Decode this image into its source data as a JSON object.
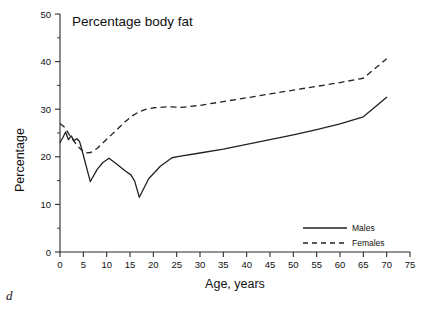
{
  "panel": {
    "label": "d"
  },
  "chart_data": {
    "type": "line",
    "title": "Percentage body fat",
    "xlabel": "Age, years",
    "ylabel": "Percentage",
    "xlim": [
      0,
      75
    ],
    "ylim": [
      0,
      50
    ],
    "xticks": [
      0,
      5,
      10,
      15,
      20,
      25,
      30,
      35,
      40,
      45,
      50,
      55,
      60,
      65,
      70,
      75
    ],
    "yticks": [
      0,
      10,
      20,
      30,
      40,
      50
    ],
    "yminorticks": [
      5,
      15,
      25,
      35,
      45
    ],
    "grid": false,
    "legend_position": "bottom-right",
    "series": [
      {
        "name": "Males",
        "style": "solid",
        "color": "#222222",
        "points": [
          [
            0,
            23.0
          ],
          [
            0.6,
            24.0
          ],
          [
            1.2,
            25.2
          ],
          [
            1.8,
            23.6
          ],
          [
            2.4,
            24.4
          ],
          [
            3.0,
            23.4
          ],
          [
            3.6,
            23.8
          ],
          [
            4.2,
            23.2
          ],
          [
            4.6,
            21.8
          ],
          [
            6.5,
            14.8
          ],
          [
            8.0,
            17.4
          ],
          [
            9.2,
            18.8
          ],
          [
            10.5,
            19.7
          ],
          [
            12.0,
            18.6
          ],
          [
            14.0,
            17.0
          ],
          [
            15.2,
            16.2
          ],
          [
            16.0,
            14.9
          ],
          [
            17.0,
            11.5
          ],
          [
            19.0,
            15.4
          ],
          [
            21.5,
            18.0
          ],
          [
            24.0,
            19.8
          ],
          [
            25.5,
            20.1
          ],
          [
            30.0,
            20.8
          ],
          [
            35.0,
            21.6
          ],
          [
            40.0,
            22.6
          ],
          [
            45.0,
            23.6
          ],
          [
            50.0,
            24.6
          ],
          [
            55.0,
            25.7
          ],
          [
            60.0,
            26.9
          ],
          [
            65.0,
            28.4
          ],
          [
            70.0,
            32.5
          ]
        ]
      },
      {
        "name": "Females",
        "style": "dashed",
        "color": "#222222",
        "points": [
          [
            0,
            27.0
          ],
          [
            1.0,
            26.2
          ],
          [
            2.0,
            24.6
          ],
          [
            3.2,
            23.0
          ],
          [
            4.4,
            21.6
          ],
          [
            5.6,
            20.8
          ],
          [
            6.6,
            20.9
          ],
          [
            8.0,
            21.8
          ],
          [
            9.5,
            23.2
          ],
          [
            11.0,
            24.6
          ],
          [
            12.5,
            26.0
          ],
          [
            14.0,
            27.4
          ],
          [
            15.5,
            28.6
          ],
          [
            17.0,
            29.5
          ],
          [
            18.5,
            30.0
          ],
          [
            20.0,
            30.3
          ],
          [
            23.0,
            30.5
          ],
          [
            26.0,
            30.4
          ],
          [
            30.0,
            30.8
          ],
          [
            35.0,
            31.6
          ],
          [
            40.0,
            32.4
          ],
          [
            45.0,
            33.2
          ],
          [
            50.0,
            34.0
          ],
          [
            55.0,
            34.8
          ],
          [
            60.0,
            35.6
          ],
          [
            65.0,
            36.5
          ],
          [
            70.0,
            40.6
          ]
        ]
      }
    ]
  },
  "legend": {
    "items": [
      {
        "label": "Males",
        "style": "solid"
      },
      {
        "label": "Females",
        "style": "dashed"
      }
    ]
  }
}
